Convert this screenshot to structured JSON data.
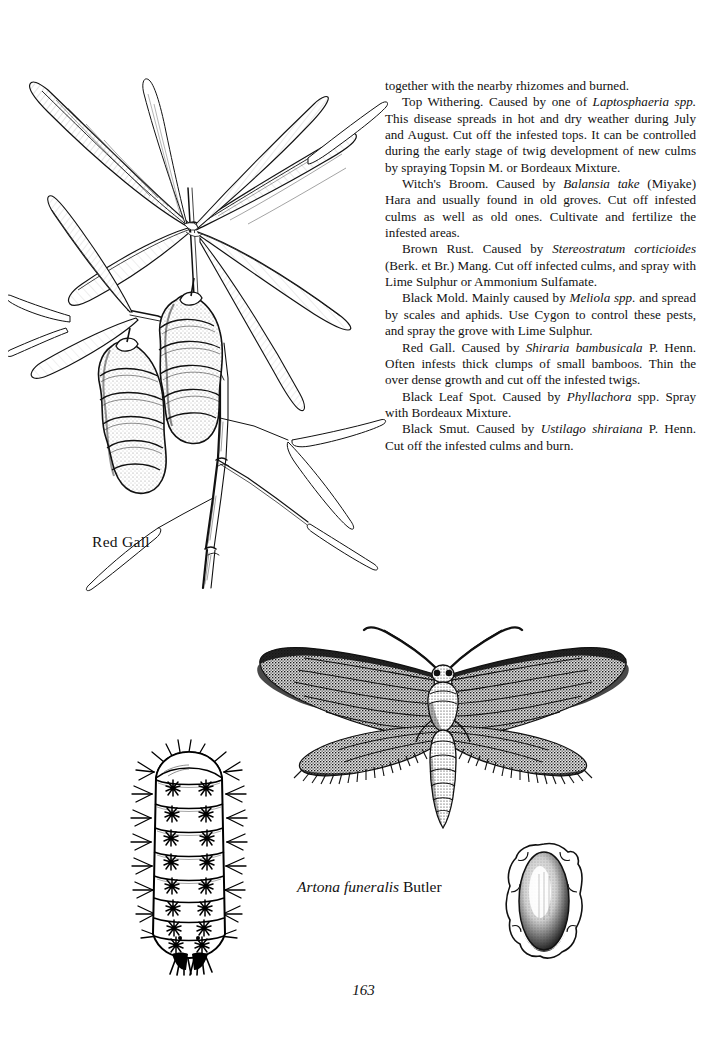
{
  "page": {
    "number": "163",
    "background_color": "#ffffff",
    "ink_color": "#000000"
  },
  "body_text": {
    "continued_paragraph": "together with the nearby rhizomes and burned.",
    "paragraphs": [
      {
        "id": "top-withering",
        "disease": "Top Withering.",
        "lead": "Top Withering. Caused by one of ",
        "organism": "Laptosphaeria spp.",
        "rest": " This disease spreads in hot and dry weather during July and August. Cut off the infested tops. It can be controlled during the early stage of twig development of new culms by spraying Topsin M. or Bordeaux Mixture."
      },
      {
        "id": "witchs-broom",
        "disease": "Witch's Broom.",
        "lead": "Witch's Broom. Caused by ",
        "organism": "Balansia take",
        "rest": " (Miyake) Hara and usually found in old groves. Cut off infested culms as well as old ones. Cultivate and fertilize the infested areas."
      },
      {
        "id": "brown-rust",
        "disease": "Brown Rust.",
        "lead": "Brown Rust. Caused by ",
        "organism": "Stereostratum corticioides",
        "rest": " (Berk. et Br.) Mang. Cut off infected culms, and spray with Lime Sulphur or Ammonium Sulfamate."
      },
      {
        "id": "black-mold",
        "disease": "Black Mold.",
        "lead": "Black Mold. Mainly caused by ",
        "organism": "Meliola spp.",
        "rest": " and spread by scales and aphids. Use Cygon to control these pests, and spray the grove with Lime Sulphur."
      },
      {
        "id": "red-gall",
        "disease": "Red Gall.",
        "lead": "Red Gall. Caused by ",
        "organism": "Shiraria bambusicala",
        "rest": " P. Henn. Often infests thick clumps of small bamboos. Thin the over dense growth and cut off the infested twigs."
      },
      {
        "id": "black-leaf-spot",
        "disease": "Black Leaf Spot.",
        "lead": "Black Leaf Spot. Caused by ",
        "organism": "Phyllachora",
        "rest": " spp. Spray with Bordeaux Mixture."
      },
      {
        "id": "black-smut",
        "disease": "Black Smut.",
        "lead": "Black Smut. Caused by ",
        "organism": "Ustilago shiraiana",
        "rest": " P. Henn. Cut off the infested culms and burn."
      }
    ]
  },
  "figures": {
    "bamboo_gall": {
      "caption": "Red Gall",
      "description": "bamboo-branch-with-red-gall-illustration"
    },
    "moth": {
      "caption_species": "Artona funeralis",
      "caption_author": " Butler",
      "description": "adult-moth-spread-wings-illustration"
    },
    "larva": {
      "description": "caterpillar-larva-dorsal-illustration"
    },
    "cocoon": {
      "description": "cocoon-pupa-illustration"
    }
  }
}
